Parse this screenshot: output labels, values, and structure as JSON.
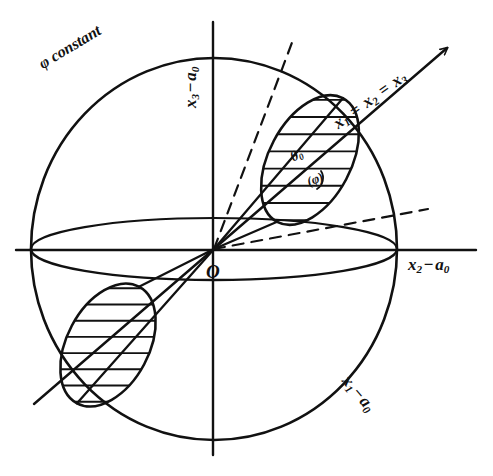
{
  "figure": {
    "type": "geometric-diagram",
    "background_color": "#ffffff",
    "ink_color": "#111111"
  },
  "labels": {
    "phi_constant": {
      "text": "φ constant",
      "x": 36,
      "y": 58,
      "rotation": -31,
      "font_size": 16
    },
    "x3_axis": {
      "text": "x3 − a0",
      "base": "x",
      "sub": "3",
      "op": "−",
      "a": "a",
      "asub": "0",
      "x": 182,
      "y": 108,
      "rotation": -90,
      "font_size": 17
    },
    "x2_axis": {
      "text": "x2 − a0",
      "base": "x",
      "sub": "2",
      "op": "−",
      "a": "a",
      "asub": "0",
      "x": 408,
      "y": 256,
      "rotation": 0,
      "font_size": 17
    },
    "x1_axis": {
      "text": "x1 − a0",
      "base": "x",
      "sub": "1",
      "op": "−",
      "a": "a",
      "asub": "0",
      "x": 352,
      "y": 372,
      "rotation": 50,
      "font_size": 17
    },
    "diagonal_axis": {
      "text": "x1 = x2 = x3",
      "x": 330,
      "y": 118,
      "rotation": -36,
      "font_size": 17
    },
    "origin": {
      "text": "O",
      "x": 206,
      "y": 262,
      "rotation": 0,
      "font_size": 19
    },
    "theta_zero": {
      "text": "θ0",
      "base": "θ",
      "sub": "0",
      "x": 288,
      "y": 152,
      "rotation": -28,
      "font_size": 14
    },
    "phi_paren": {
      "text": "(φ)",
      "x": 305,
      "y": 176,
      "rotation": -22,
      "font_size": 13
    }
  },
  "geometry": {
    "sphere": {
      "cx": 214,
      "cy": 249,
      "rx": 183,
      "ry": 191
    },
    "equator_ellipse": {
      "cx": 214,
      "cy": 249,
      "rx": 183,
      "ry": 31
    },
    "upper_cone_ellipse": {
      "cx": 310,
      "cy": 160,
      "rx": 41,
      "ry": 70,
      "rotation": 28
    },
    "lower_cone_ellipse": {
      "cx": 108,
      "cy": 345,
      "rx": 41,
      "ry": 66,
      "rotation": 28
    },
    "axis_horizontal": {
      "x1": 16,
      "y1": 250,
      "x2": 476,
      "y2": 250
    },
    "axis_vertical": {
      "x1": 213,
      "y1": 22,
      "x2": 213,
      "y2": 455
    },
    "axis_diagonal_main": {
      "x1": 34,
      "y1": 404,
      "x2": 447,
      "y2": 48
    },
    "dashed_polar": {
      "x1": 214,
      "y1": 249,
      "x2": 293,
      "y2": 40
    },
    "dashed_radial": {
      "x1": 214,
      "y1": 249,
      "x2": 428,
      "y2": 209
    },
    "hatch_count_upper": 11,
    "hatch_count_lower": 11
  }
}
